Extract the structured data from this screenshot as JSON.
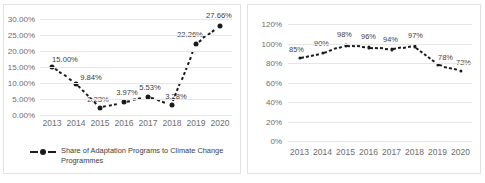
{
  "page": {
    "background": "#ffffff",
    "series_color": "#1b1b1b",
    "gridline_color": "#e6e6e6",
    "tick_color": "#6d6d6d"
  },
  "chart_data": [
    {
      "id": "left",
      "type": "line",
      "title": "",
      "xlabel": "",
      "ylabel": "",
      "categories": [
        "2013",
        "2014",
        "2015",
        "2016",
        "2017",
        "2018",
        "2019",
        "2020"
      ],
      "values": [
        15.0,
        9.84,
        2.23,
        3.97,
        5.53,
        3.28,
        22.26,
        27.66
      ],
      "data_labels": [
        "15.00%",
        "9.84%",
        "2.23%",
        "3.97%",
        "5.53%",
        "3.28%",
        "22.26%",
        "27.66%"
      ],
      "ytick_labels": [
        "30.00%",
        "25.00%",
        "20.00%",
        "15.00%",
        "10.00%",
        "5.00%",
        "0.00%"
      ],
      "ytick_values": [
        30,
        25,
        20,
        15,
        10,
        5,
        0
      ],
      "ylim": [
        0,
        30
      ],
      "grid": true,
      "legend_position": "bottom",
      "legend": [
        {
          "label": "Share of Adaptation Programs to Climate Change Programmes",
          "marker": "dashed-line-with-dot"
        }
      ]
    },
    {
      "id": "right",
      "type": "line",
      "title": "",
      "xlabel": "",
      "ylabel": "",
      "categories": [
        "2013",
        "2014",
        "2015",
        "2016",
        "2017",
        "2018",
        "2019",
        "2020"
      ],
      "values": [
        85,
        90,
        98,
        96,
        94,
        97,
        78,
        72
      ],
      "data_labels": [
        "85%",
        "90%",
        "98%",
        "96%",
        "94%",
        "97%",
        "78%",
        "72%"
      ],
      "ytick_labels": [
        "120%",
        "100%",
        "80%",
        "60%",
        "40%",
        "20%",
        "0%"
      ],
      "ytick_values": [
        120,
        100,
        80,
        60,
        40,
        20,
        0
      ],
      "ylim": [
        0,
        120
      ],
      "grid": true,
      "legend_position": "none",
      "legend": []
    }
  ]
}
